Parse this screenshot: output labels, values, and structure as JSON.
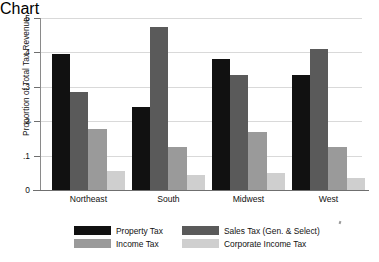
{
  "chart_data": {
    "type": "bar",
    "title": "",
    "subtitle": "",
    "xlabel": "",
    "ylabel": "Proportion of Total Tax Revenue",
    "ylim": [
      0,
      0.5
    ],
    "yticks": [
      0,
      0.1,
      0.2,
      0.3,
      0.4,
      0.5
    ],
    "ytick_labels": [
      "0",
      ".1",
      ".2",
      ".3",
      ".4",
      ".5"
    ],
    "grid": true,
    "grid_axis": "y",
    "legend_position": "bottom",
    "categories": [
      "Northeast",
      "South",
      "Midwest",
      "West"
    ],
    "series": [
      {
        "name": "Property Tax",
        "color": "#111111",
        "values": [
          0.395,
          0.24,
          0.38,
          0.335
        ]
      },
      {
        "name": "Income Tax",
        "color": "#5a5a5a",
        "values": [
          0.285,
          0.475,
          0.335,
          0.41
        ]
      },
      {
        "name": "Sales Tax (Gen. & Select)",
        "color": "#9a9a9a",
        "values": [
          0.178,
          0.125,
          0.17,
          0.125
        ]
      },
      {
        "name": "Corporate Income Tax",
        "color": "#cfcfcf",
        "values": [
          0.055,
          0.045,
          0.05,
          0.035
        ]
      }
    ],
    "legend_entries": [
      {
        "label": "Property Tax",
        "color": "#111111"
      },
      {
        "label": "Sales Tax (Gen. & Select)",
        "color": "#5a5a5a"
      },
      {
        "label": "Income Tax",
        "color": "#9a9a9a"
      },
      {
        "label": "Corporate Income Tax",
        "color": "#cfcfcf"
      }
    ]
  },
  "axis": {
    "y_title": "Proportion of Total Tax Revenue"
  },
  "colors": {
    "background": "#ffffff",
    "grid": "#d9d9d9",
    "axis": "#6f6f6f",
    "text": "#111111"
  }
}
